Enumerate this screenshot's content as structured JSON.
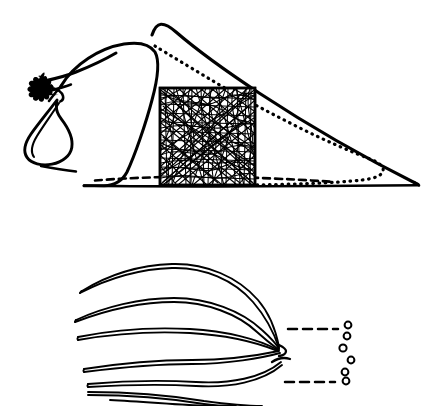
{
  "figure": {
    "background_color": "#ffffff",
    "ink_color": "#000000",
    "width": 442,
    "height": 406,
    "panels": [
      {
        "id": "upper-panel",
        "name": "diaspore-lateral-view",
        "description": "Lateral outline of a seed body with feathery awn tuft at left, pear-shaped bulb below the tuft, a dotted inner outline, and a dense cross-hatched square region at centre.",
        "features": [
          {
            "name": "outer-outline",
            "style": "solid"
          },
          {
            "name": "inner-outline",
            "style": "solid"
          },
          {
            "name": "inner-dotted-outline",
            "style": "dotted"
          },
          {
            "name": "basal-dashed-line",
            "style": "dashed"
          },
          {
            "name": "hatched-square",
            "style": "dense-scribble"
          },
          {
            "name": "feather-tuft",
            "style": "filled"
          },
          {
            "name": "teardrop-bulb",
            "style": "solid"
          },
          {
            "name": "ground-line",
            "style": "solid"
          }
        ]
      },
      {
        "id": "lower-panel",
        "name": "bristle-fan-detail",
        "description": "Seven elongated bristles fanning out from a common attachment point at the right, with two dashed leader lines running right to a vertical column of six small open circles.",
        "bristle_count": 7,
        "leader_lines": 2,
        "circle_count": 6,
        "features": [
          {
            "name": "bristle",
            "style": "solid-double-line"
          },
          {
            "name": "convergence-point",
            "style": "solid"
          },
          {
            "name": "leader-line-upper",
            "style": "dashed"
          },
          {
            "name": "leader-line-lower",
            "style": "dashed"
          },
          {
            "name": "detached-circle",
            "style": "open-circle"
          }
        ]
      }
    ]
  },
  "chart_data": {
    "type": "scatter",
    "title": "",
    "xlabel": "",
    "ylabel": "",
    "grid": false,
    "legend": null,
    "series": [
      {
        "name": "detached-circles",
        "marker": "open-circle",
        "points": [
          {
            "x": 348,
            "y": 325,
            "r": 3.4
          },
          {
            "x": 347,
            "y": 336,
            "r": 3.4
          },
          {
            "x": 343,
            "y": 348,
            "r": 3.6
          },
          {
            "x": 351,
            "y": 360,
            "r": 3.4
          },
          {
            "x": 345,
            "y": 372,
            "r": 3.4
          },
          {
            "x": 346,
            "y": 381,
            "r": 3.4
          }
        ]
      }
    ]
  }
}
